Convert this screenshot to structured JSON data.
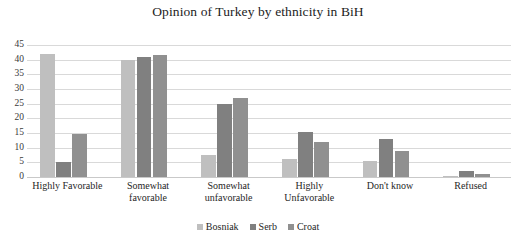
{
  "chart_data": {
    "type": "bar",
    "title": "Opinion of Turkey by ethnicity in BiH",
    "xlabel": "",
    "ylabel": "",
    "ylim": [
      0,
      45
    ],
    "yticks": [
      0,
      5,
      10,
      15,
      20,
      25,
      30,
      35,
      40,
      45
    ],
    "grid": true,
    "legend_position": "bottom",
    "categories": [
      "Highly Favorable",
      "Somewhat favorable",
      "Somewhat unfavorable",
      "Highly Unfavorable",
      "Don't know",
      "Refused"
    ],
    "category_lines": [
      [
        "Highly Favorable"
      ],
      [
        "Somewhat",
        "favorable"
      ],
      [
        "Somewhat",
        "unfavorable"
      ],
      [
        "Highly",
        "Unfavorable"
      ],
      [
        "Don't know"
      ],
      [
        "Refused"
      ]
    ],
    "series": [
      {
        "name": "Bosniak",
        "color": "#bfbfbf",
        "values": [
          42,
          40,
          7.5,
          6,
          5.5,
          0.4
        ]
      },
      {
        "name": "Serb",
        "color": "#808080",
        "values": [
          5,
          41,
          25,
          15.5,
          13,
          2
        ]
      },
      {
        "name": "Croat",
        "color": "#909090",
        "values": [
          14.5,
          41.5,
          27,
          12,
          9,
          1
        ]
      }
    ]
  }
}
